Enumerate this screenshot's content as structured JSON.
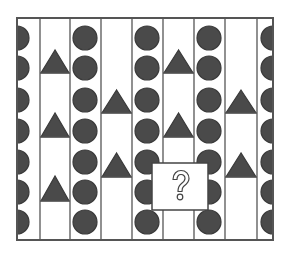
{
  "puzzle": {
    "type": "pattern-completion",
    "question_mark": "?",
    "colors": {
      "background": "#ffffff",
      "frame_stroke": "#555555",
      "shape_fill": "#4a4a4a",
      "shape_stroke": "#3a3a3a",
      "qbox_fill": "#ffffff",
      "qbox_stroke": "#444444"
    },
    "frame": {
      "x": 17,
      "y": 18,
      "width": 256,
      "height": 222
    },
    "dividers_x": [
      40,
      70,
      101,
      132,
      163,
      194,
      225,
      257
    ],
    "circle_rows_y": [
      38,
      68,
      100,
      131,
      162,
      192,
      222
    ],
    "circle_radius": 12,
    "columns": [
      {
        "id": "A",
        "kind": "half-circles-left",
        "cx": 17
      },
      {
        "id": "B",
        "kind": "triangles",
        "x0": 40,
        "x1": 70,
        "triangles": [
          {
            "apex": 50,
            "base": 73
          },
          {
            "apex": 113,
            "base": 137
          },
          {
            "apex": 176,
            "base": 201
          }
        ]
      },
      {
        "id": "C",
        "kind": "circles",
        "cx": 85
      },
      {
        "id": "D",
        "kind": "triangles",
        "x0": 101,
        "x1": 132,
        "triangles": [
          {
            "apex": 90,
            "base": 113
          },
          {
            "apex": 153,
            "base": 177
          }
        ]
      },
      {
        "id": "E",
        "kind": "circles",
        "cx": 147
      },
      {
        "id": "F",
        "kind": "triangles",
        "x0": 163,
        "x1": 194,
        "triangles": [
          {
            "apex": 50,
            "base": 73
          },
          {
            "apex": 113,
            "base": 137
          },
          {
            "apex": 176,
            "base": 201
          }
        ]
      },
      {
        "id": "G",
        "kind": "circles",
        "cx": 209
      },
      {
        "id": "H",
        "kind": "triangles",
        "x0": 225,
        "x1": 257,
        "triangles": [
          {
            "apex": 90,
            "base": 113
          },
          {
            "apex": 153,
            "base": 177
          }
        ]
      },
      {
        "id": "I",
        "kind": "half-circles-right",
        "cx": 273
      }
    ],
    "question_box": {
      "x": 152,
      "y": 163,
      "width": 56,
      "height": 47
    }
  }
}
